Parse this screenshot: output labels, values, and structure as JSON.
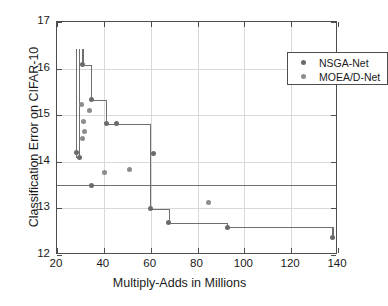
{
  "chart_data": {
    "type": "scatter",
    "title": "",
    "xlabel": "Multiply-Adds in Millions",
    "ylabel": "Classification Error on CIFAR-10",
    "xlim": [
      20,
      140
    ],
    "ylim": [
      12,
      17
    ],
    "xticks": [
      20,
      40,
      60,
      80,
      100,
      120,
      140
    ],
    "yticks": [
      12,
      13,
      14,
      15,
      16,
      17
    ],
    "grid": true,
    "legend_position": "top-right",
    "series": [
      {
        "name": "NSGA-Net",
        "color": "#6b6b6b",
        "marker": "circle",
        "points": [
          [
            30.8,
            16.08
          ],
          [
            34.6,
            15.33
          ],
          [
            41.0,
            14.82
          ],
          [
            45.5,
            14.83
          ],
          [
            61.4,
            14.18
          ],
          [
            28.2,
            14.19
          ],
          [
            29.4,
            14.09
          ],
          [
            34.8,
            13.5
          ],
          [
            59.8,
            12.99
          ],
          [
            67.8,
            12.69
          ],
          [
            92.6,
            12.6
          ],
          [
            137.6,
            12.38
          ]
        ]
      },
      {
        "name": "MOEA/D-Net",
        "color": "#8c8c8c",
        "marker": "circle",
        "points": [
          [
            30.6,
            15.23
          ],
          [
            34.0,
            15.11
          ],
          [
            31.4,
            14.86
          ],
          [
            31.6,
            14.65
          ],
          [
            31.0,
            14.51
          ],
          [
            40.2,
            13.76
          ],
          [
            51.0,
            13.84
          ],
          [
            84.6,
            13.13
          ]
        ]
      }
    ],
    "step_line": {
      "name": "NSGA-Net Pareto front",
      "color": "#6f6f6f",
      "vertices": [
        [
          28.2,
          16.42
        ],
        [
          28.2,
          14.19
        ],
        [
          29.4,
          14.09
        ],
        [
          30.8,
          16.42
        ],
        [
          30.8,
          16.08
        ],
        [
          34.6,
          16.08
        ],
        [
          34.6,
          15.33
        ],
        [
          41.0,
          15.33
        ],
        [
          41.0,
          14.82
        ],
        [
          59.8,
          14.82
        ],
        [
          59.8,
          12.99
        ],
        [
          67.8,
          12.99
        ],
        [
          67.8,
          12.69
        ],
        [
          92.6,
          12.69
        ],
        [
          92.6,
          12.6
        ],
        [
          137.6,
          12.6
        ],
        [
          137.6,
          12.38
        ]
      ]
    },
    "reference_line": {
      "name": "MOEA/D-Net baseline",
      "color": "#6f6f6f",
      "y": 13.51,
      "orientation": "horizontal"
    }
  },
  "legend": {
    "entries": [
      {
        "label": "NSGA-Net"
      },
      {
        "label": "MOEA/D-Net"
      }
    ]
  },
  "axes": {
    "x_tick_labels": [
      "20",
      "40",
      "60",
      "80",
      "100",
      "120",
      "140"
    ],
    "y_tick_labels": [
      "12",
      "13",
      "14",
      "15",
      "16",
      "17"
    ],
    "x_title": "Multiply-Adds in Millions",
    "y_title": "Classification Error on CIFAR-10"
  }
}
